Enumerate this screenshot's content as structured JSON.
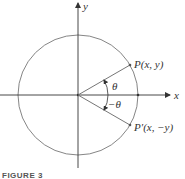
{
  "figure": {
    "caption": "FIGURE 3",
    "axes": {
      "x_label": "x",
      "y_label": "y"
    },
    "circle": {
      "center": [
        78,
        95
      ],
      "radius": 60
    },
    "points": [
      {
        "name": "P",
        "label": "P(x, y)",
        "angle_deg": 30
      },
      {
        "name": "P'",
        "label": "P′(x, −y)",
        "angle_deg": -30
      }
    ],
    "angles": {
      "positive": "θ",
      "negative": "−θ"
    },
    "colors": {
      "axis": "#333333",
      "circle": "#777777",
      "ray": "#666666",
      "text": "#333333"
    }
  }
}
